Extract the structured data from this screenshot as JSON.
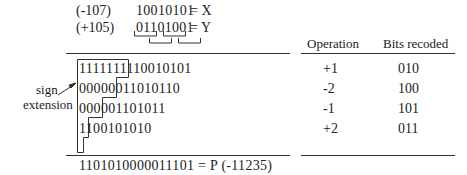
{
  "operands": {
    "x": {
      "decimal": "(-107)",
      "bits": "10010101",
      "label": "= X"
    },
    "y": {
      "decimal": "(+105)",
      "bits": "01101001",
      "label": "= Y"
    }
  },
  "partial_products": [
    {
      "bits": "1111111110010101"
    },
    {
      "bits": "00000011010110"
    },
    {
      "bits": "000001101011"
    },
    {
      "bits": "1100101010"
    }
  ],
  "sign_extension_label": {
    "line1": "sign",
    "line2": "extension"
  },
  "result": {
    "text": "1101010000011101 = P  (-11235)"
  },
  "table": {
    "headers": [
      "Operation",
      "Bits recoded"
    ],
    "rows": [
      {
        "operation": "+1",
        "bits": "010"
      },
      {
        "operation": "-2",
        "bits": "100"
      },
      {
        "operation": "-1",
        "bits": "101"
      },
      {
        "operation": "+2",
        "bits": "011"
      }
    ]
  }
}
